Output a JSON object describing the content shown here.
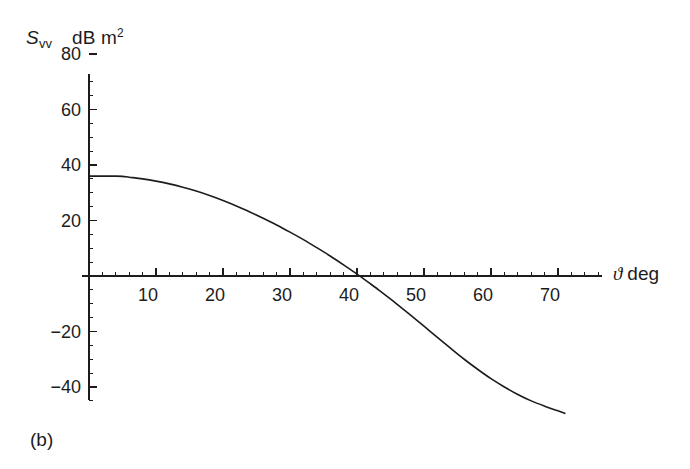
{
  "figure": {
    "panel_label": "(b)",
    "background_color": "#ffffff",
    "ink_color": "#1c1c1c"
  },
  "axis_titles": {
    "y_symbol": "S",
    "y_subscript": "vv",
    "y_units_prefix": "dB m",
    "y_units_exponent": "2",
    "y_full": "Svv  dB m2",
    "x_symbol": "ϑ",
    "x_units": "deg",
    "x_full": "ϑ deg"
  },
  "chart_data": {
    "type": "line",
    "title": "",
    "subtitle": "",
    "xlabel": "ϑ deg",
    "ylabel": "S_vv  dB m²",
    "xlim": [
      0,
      76
    ],
    "ylim": [
      -52,
      80
    ],
    "grid": false,
    "legend": null,
    "x_ticks": [
      10,
      20,
      30,
      40,
      50,
      60,
      70
    ],
    "x_tick_labels": [
      "10",
      "20",
      "30",
      "40",
      "50",
      "60",
      "70"
    ],
    "x_minor_tick_step": 2,
    "y_ticks": [
      80,
      60,
      40,
      20,
      0,
      -20,
      -40
    ],
    "y_tick_labels": [
      "80",
      "60",
      "40",
      "20",
      "",
      "−20",
      "−40"
    ],
    "y_minor_tick_step": 5,
    "y_tick_label_visible": [
      true,
      true,
      true,
      true,
      false,
      true,
      true
    ],
    "annotations": [
      {
        "text": "(b)",
        "position": "bottom-left"
      }
    ],
    "series": [
      {
        "name": "Svv",
        "color": "#1c1c1c",
        "line_width": 1.6,
        "x": [
          0,
          2,
          4,
          5,
          6,
          8,
          10,
          12,
          14,
          16,
          18,
          20,
          22,
          24,
          26,
          28,
          30,
          32,
          34,
          36,
          38,
          40,
          42,
          43,
          44,
          46,
          48,
          50,
          52,
          54,
          56,
          58,
          60,
          62,
          64,
          66,
          68,
          70,
          71
        ],
        "y": [
          36.0,
          36.0,
          36.0,
          35.9,
          35.6,
          35.0,
          34.2,
          33.2,
          32.0,
          30.6,
          29.0,
          27.2,
          25.2,
          23.1,
          20.8,
          18.4,
          15.8,
          13.1,
          10.2,
          7.2,
          4.0,
          0.7,
          -2.8,
          -4.6,
          -6.4,
          -10.2,
          -14.1,
          -18.1,
          -22.1,
          -26.1,
          -30.0,
          -33.6,
          -37.0,
          -40.0,
          -42.7,
          -45.0,
          -46.9,
          -48.6,
          -49.5
        ]
      }
    ],
    "zero_crossing_x": 43,
    "plateau_value": 36,
    "end_value": -49.5
  },
  "geometry": {
    "origin_px": {
      "x": 89,
      "y": 276
    },
    "x_px_per_degree": 6.7,
    "y_px_per_db": 2.775,
    "x_axis_end_px": 602,
    "y_axis_top_px": 74,
    "y_axis_bottom_px": 400
  }
}
